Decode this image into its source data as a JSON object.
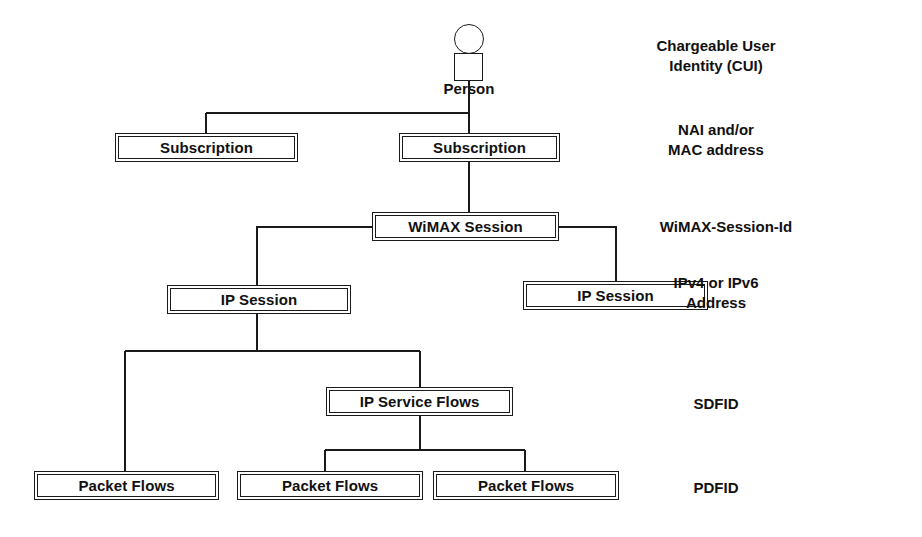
{
  "diagram": {
    "type": "tree-diagram",
    "line_color": "#1a1a1a",
    "text_color": "#111111",
    "background": "#ffffff",
    "actor": {
      "label": "Person",
      "icon": "person-figure"
    },
    "nodes": [
      {
        "id": "subscription_left",
        "label": "Subscription",
        "x": 115,
        "y": 133,
        "w": 183,
        "h": 29
      },
      {
        "id": "subscription_right",
        "label": "Subscription",
        "x": 399,
        "y": 133,
        "w": 161,
        "h": 29
      },
      {
        "id": "wimax_session",
        "label": "WiMAX Session",
        "x": 372,
        "y": 212,
        "w": 187,
        "h": 29
      },
      {
        "id": "ip_session_left",
        "label": "IP Session",
        "x": 167,
        "y": 285,
        "w": 184,
        "h": 29
      },
      {
        "id": "ip_session_right",
        "label": "IP Session",
        "x": 523,
        "y": 281,
        "w": 185,
        "h": 29
      },
      {
        "id": "ip_service_flows",
        "label": "IP Service Flows",
        "x": 326,
        "y": 387,
        "w": 187,
        "h": 29
      },
      {
        "id": "packet_flows_1",
        "label": "Packet Flows",
        "x": 34,
        "y": 471,
        "w": 185,
        "h": 29
      },
      {
        "id": "packet_flows_2",
        "label": "Packet Flows",
        "x": 237,
        "y": 471,
        "w": 186,
        "h": 29
      },
      {
        "id": "packet_flows_3",
        "label": "Packet Flows",
        "x": 433,
        "y": 471,
        "w": 186,
        "h": 29
      }
    ],
    "side_labels": [
      {
        "id": "cui",
        "text": "Chargeable User\nIdentity (CUI)",
        "x": 716,
        "y": 36
      },
      {
        "id": "nai_mac",
        "text": "NAI and/or\nMAC address",
        "x": 716,
        "y": 120
      },
      {
        "id": "wimax_sid",
        "text": "WiMAX-Session-Id",
        "x": 716,
        "y": 217
      },
      {
        "id": "ip_address",
        "text": "IPv4 or IPv6\nAddress",
        "x": 716,
        "y": 273
      },
      {
        "id": "sdfid",
        "text": "SDFID",
        "x": 716,
        "y": 394
      },
      {
        "id": "pdfid",
        "text": "PDFID",
        "x": 716,
        "y": 478
      }
    ],
    "edges": [
      {
        "from": "person",
        "to": "bus_person"
      },
      {
        "from": "bus_person",
        "to": "subscription_left"
      },
      {
        "from": "bus_person",
        "to": "subscription_right"
      },
      {
        "from": "subscription_right",
        "to": "wimax_session"
      },
      {
        "from": "wimax_session",
        "to": "ip_session_left"
      },
      {
        "from": "wimax_session",
        "to": "ip_session_right"
      },
      {
        "from": "ip_session_left",
        "to": "bus_flows"
      },
      {
        "from": "bus_flows",
        "to": "packet_flows_1"
      },
      {
        "from": "bus_flows",
        "to": "ip_service_flows"
      },
      {
        "from": "ip_service_flows",
        "to": "packet_flows_2"
      },
      {
        "from": "ip_service_flows",
        "to": "packet_flows_3"
      }
    ]
  }
}
